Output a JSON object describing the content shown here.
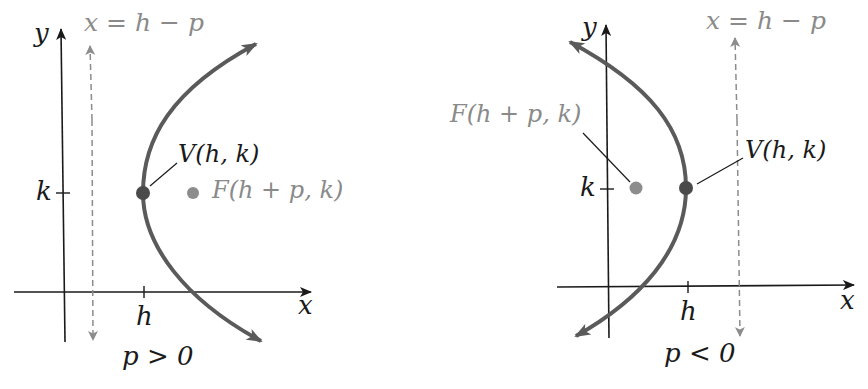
{
  "colors": {
    "axis": "#1a1a1a",
    "curve": "#5a5a5a",
    "vertex": "#4a4a4a",
    "focus": "#8c8c8c",
    "directrix": "#8c8c8c",
    "directrix_label": "#8a8a8a",
    "text": "#1a1a1a"
  },
  "panels": [
    {
      "id": "right-opening",
      "axes": {
        "x_label": "x",
        "y_label": "y"
      },
      "ticks": {
        "k_label": "k",
        "h_label": "h"
      },
      "directrix_label": "x = h − p",
      "vertex_label": "V(h, k)",
      "focus_label": "F(h + p, k)",
      "caption": "p > 0"
    },
    {
      "id": "left-opening",
      "axes": {
        "x_label": "x",
        "y_label": "y"
      },
      "ticks": {
        "k_label": "k",
        "h_label": "h"
      },
      "directrix_label": "x = h − p",
      "vertex_label": "V(h, k)",
      "focus_label": "F(h + p, k)",
      "caption": "p < 0"
    }
  ]
}
